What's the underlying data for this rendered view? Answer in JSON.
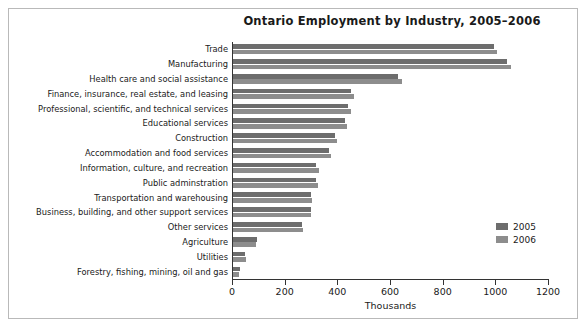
{
  "chart_data": {
    "type": "bar",
    "orientation": "horizontal",
    "title": "Ontario Employment by Industry, 2005–2006",
    "xlabel": "Thousands",
    "ylabel": "",
    "xlim": [
      0,
      1200
    ],
    "xticks": [
      0,
      200,
      400,
      600,
      800,
      1000,
      1200
    ],
    "xtick_labels": [
      "0",
      "200",
      "400",
      "600",
      "800",
      "1000",
      "1200"
    ],
    "grid": false,
    "legend_position": "right-inside",
    "categories": [
      "Trade",
      "Manufacturing",
      "Health care and social assistance",
      "Finance, insurance, real estate, and leasing",
      "Professional, scientific, and technical services",
      "Educational services",
      "Construction",
      "Accommodation and food services",
      "Information, culture, and recreation",
      "Public adminstration",
      "Transportation and warehousing",
      "Business, building, and other support services",
      "Other services",
      "Agriculture",
      "Utilities",
      "Forestry, fishing, mining, oil and gas"
    ],
    "series": [
      {
        "name": "2005",
        "color": "#6d6d6d",
        "values": [
          995,
          1045,
          630,
          450,
          440,
          430,
          390,
          370,
          320,
          320,
          300,
          300,
          265,
          95,
          50,
          30
        ]
      },
      {
        "name": "2006",
        "color": "#8d8d8d",
        "values": [
          1005,
          1060,
          645,
          465,
          450,
          435,
          400,
          375,
          330,
          325,
          305,
          300,
          270,
          90,
          52,
          28
        ]
      }
    ]
  },
  "legend": {
    "items": [
      {
        "label": "2005",
        "color": "#6d6d6d"
      },
      {
        "label": "2006",
        "color": "#8d8d8d"
      }
    ]
  }
}
